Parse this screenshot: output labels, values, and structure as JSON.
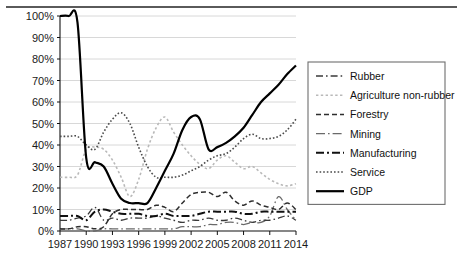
{
  "chart_data": {
    "type": "line",
    "title": "",
    "xlabel": "",
    "ylabel": "",
    "xlim": [
      1987,
      2014
    ],
    "ylim": [
      0,
      100
    ],
    "ytick_format": "percent",
    "grid": true,
    "legend_position": "right",
    "x": [
      1987,
      1988,
      1989,
      1990,
      1991,
      1992,
      1993,
      1994,
      1995,
      1996,
      1997,
      1998,
      1999,
      2000,
      2001,
      2002,
      2003,
      2004,
      2005,
      2006,
      2007,
      2008,
      2009,
      2010,
      2011,
      2012,
      2013,
      2014
    ],
    "xticks": [
      "1987",
      "1990",
      "1993",
      "1996",
      "1999",
      "2002",
      "2005",
      "2008",
      "2011",
      "2014"
    ],
    "yticks": [
      "0%",
      "10%",
      "20%",
      "30%",
      "40%",
      "50%",
      "60%",
      "70%",
      "80%",
      "90%",
      "100%"
    ],
    "series": [
      {
        "name": "Rubber",
        "style": "dash-dot",
        "color": "#3a3a3a",
        "width": 1.3,
        "values": [
          5,
          5,
          6,
          7,
          11,
          5,
          6,
          5,
          6,
          6,
          6,
          7,
          6,
          5,
          4,
          5,
          5,
          6,
          5,
          5,
          6,
          5,
          4,
          5,
          5,
          6,
          7,
          5
        ]
      },
      {
        "name": "Agriculture non-rubber",
        "style": "dotted-light",
        "color": "#b9b9b9",
        "width": 1.6,
        "values": [
          25,
          25,
          26,
          38,
          39,
          38,
          33,
          25,
          16,
          24,
          38,
          48,
          53,
          46,
          40,
          35,
          31,
          29,
          33,
          35,
          32,
          29,
          30,
          27,
          24,
          22,
          21,
          22
        ]
      },
      {
        "name": "Forestry",
        "style": "dashed",
        "color": "#2e2e2e",
        "width": 1.5,
        "values": [
          1,
          1,
          2,
          2,
          1,
          2,
          8,
          10,
          10,
          10,
          10,
          12,
          11,
          9,
          13,
          17,
          18,
          18,
          16,
          18,
          14,
          12,
          14,
          12,
          11,
          10,
          13,
          10
        ]
      },
      {
        "name": "Mining",
        "style": "long-dash-dot",
        "color": "#6a6a6a",
        "width": 1.3,
        "values": [
          1,
          1,
          1,
          0,
          0,
          1,
          1,
          1,
          1,
          1,
          1,
          1,
          1,
          1,
          2,
          2,
          2,
          3,
          3,
          4,
          4,
          3,
          4,
          4,
          7,
          16,
          10,
          5
        ]
      },
      {
        "name": "Manufacturing",
        "style": "dash-dot-heavy",
        "color": "#111111",
        "width": 2.0,
        "values": [
          7,
          7,
          7,
          5,
          9,
          10,
          9,
          8,
          8,
          8,
          7,
          7,
          8,
          7,
          7,
          7,
          8,
          9,
          9,
          9,
          9,
          8,
          8,
          9,
          9,
          9,
          9,
          9
        ]
      },
      {
        "name": "Service",
        "style": "dotted-fine",
        "color": "#4a4a4a",
        "width": 1.6,
        "values": [
          44,
          44,
          44,
          40,
          38,
          46,
          52,
          55,
          50,
          39,
          30,
          25,
          25,
          25,
          26,
          28,
          30,
          33,
          35,
          36,
          39,
          43,
          45,
          43,
          43,
          44,
          47,
          52
        ]
      },
      {
        "name": "GDP",
        "style": "solid",
        "color": "#000000",
        "width": 2.2,
        "values": [
          100,
          100,
          97,
          34,
          32,
          30,
          22,
          15,
          13,
          13,
          13,
          20,
          28,
          36,
          47,
          53,
          52,
          38,
          39,
          41,
          44,
          48,
          54,
          60,
          64,
          68,
          73,
          77
        ]
      }
    ]
  },
  "legend": {
    "items": [
      {
        "label": "Rubber"
      },
      {
        "label": "Agriculture non-rubber"
      },
      {
        "label": "Forestry"
      },
      {
        "label": "Mining"
      },
      {
        "label": "Manufacturing"
      },
      {
        "label": "Service"
      },
      {
        "label": "GDP"
      }
    ]
  }
}
